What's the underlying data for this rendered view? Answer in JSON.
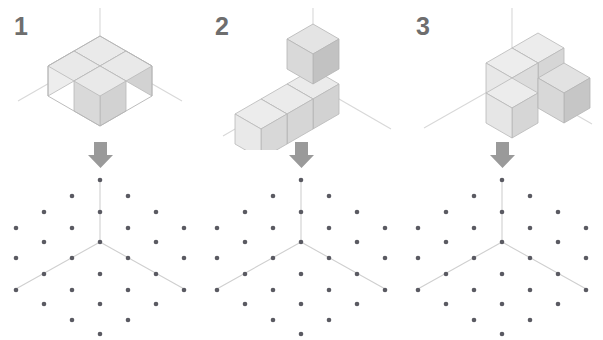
{
  "figure": {
    "title": "",
    "background_color": "#ffffff",
    "panel_count": 3
  },
  "colors": {
    "cube_top": "#e9e9e9",
    "cube_left": "#ebebeb",
    "cube_right": "#d2d2d2",
    "cube_edge": "#b4b4b4",
    "axis_line": "#d8d8d8",
    "lattice_line": "#cfcfcf",
    "dot": "#5a5a62",
    "arrow": "#9a9a9a",
    "number": "#6e6e6e"
  },
  "geometry": {
    "iso_dx": 26,
    "iso_dy": 15,
    "cube_height": 30,
    "lattice_dx": 28,
    "lattice_dy": 16,
    "dot_radius": 2.3
  },
  "panels": [
    {
      "id": "panel-1",
      "number_label": "1",
      "arrow_icon": "down-arrow-icon",
      "shape": {
        "name": "two-by-two-slab",
        "cube_count": 4,
        "cubes": [
          [
            0,
            0,
            0
          ],
          [
            1,
            0,
            0
          ],
          [
            0,
            1,
            0
          ],
          [
            1,
            1,
            0
          ]
        ]
      },
      "lattice": {
        "name": "isometric-dot-lattice",
        "dot_count": 25,
        "axes": [
          "up",
          "down-left",
          "down-right"
        ],
        "dots": [
          [
            0,
            0,
            2
          ],
          [
            0,
            0,
            1
          ],
          [
            0,
            0,
            0
          ],
          [
            1,
            0,
            0
          ],
          [
            2,
            0,
            0
          ],
          [
            1,
            1,
            0
          ],
          [
            2,
            2,
            0
          ],
          [
            0,
            1,
            0
          ],
          [
            0,
            2,
            0
          ],
          [
            1,
            2,
            0
          ],
          [
            2,
            1,
            0
          ],
          [
            1,
            0,
            1
          ],
          [
            2,
            0,
            1
          ],
          [
            0,
            1,
            1
          ],
          [
            0,
            2,
            1
          ],
          [
            1,
            1,
            1
          ],
          [
            2,
            2,
            1
          ],
          [
            1,
            2,
            1
          ],
          [
            2,
            1,
            1
          ],
          [
            1,
            0,
            2
          ],
          [
            0,
            1,
            2
          ],
          [
            1,
            1,
            2
          ],
          [
            2,
            0,
            2
          ],
          [
            0,
            2,
            2
          ],
          [
            2,
            2,
            2
          ]
        ]
      }
    },
    {
      "id": "panel-2",
      "number_label": "2",
      "arrow_icon": "down-arrow-icon",
      "shape": {
        "name": "l-shape-row-with-stack",
        "cube_count": 4,
        "cubes": [
          [
            0,
            0,
            0
          ],
          [
            1,
            0,
            0
          ],
          [
            2,
            0,
            0
          ],
          [
            2,
            0,
            1
          ]
        ]
      },
      "lattice": {
        "name": "isometric-dot-lattice",
        "dot_count": 25,
        "axes": [
          "up",
          "down-left",
          "down-right"
        ]
      }
    },
    {
      "id": "panel-3",
      "number_label": "3",
      "arrow_icon": "down-arrow-icon",
      "shape": {
        "name": "planar-s-tetracube",
        "cube_count": 4,
        "cubes": [
          [
            0,
            0,
            0
          ],
          [
            0,
            1,
            0
          ],
          [
            1,
            1,
            0
          ],
          [
            1,
            0,
            0
          ]
        ]
      },
      "lattice": {
        "name": "isometric-dot-lattice",
        "dot_count": 25,
        "axes": [
          "up",
          "down-left",
          "down-right"
        ]
      }
    }
  ]
}
